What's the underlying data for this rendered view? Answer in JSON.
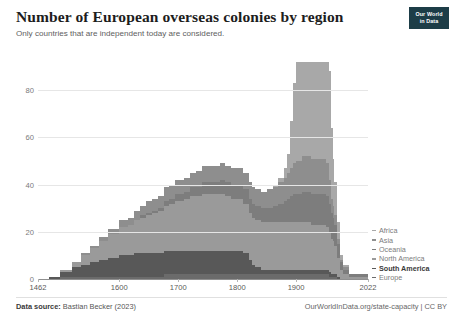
{
  "header": {
    "title": "Number of European overseas colonies by region",
    "subtitle": "Only countries that are independent today are considered.",
    "logo_line1": "Our World",
    "logo_line2": "in Data"
  },
  "footer": {
    "source_label": "Data source:",
    "source_value": "Bastian Becker (2023)",
    "credit": "OurWorldInData.org/state-capacity | CC BY"
  },
  "chart_data": {
    "type": "area",
    "stacked": true,
    "title": "Number of European overseas colonies by region",
    "subtitle": "Only countries that are independent today are considered.",
    "xlabel": "",
    "ylabel": "",
    "xlim": [
      1462,
      2022
    ],
    "ylim": [
      0,
      92
    ],
    "grid": true,
    "legend_position": "right",
    "yticks": [
      "0",
      "20",
      "40",
      "60",
      "80"
    ],
    "ytick_values": [
      0,
      20,
      40,
      60,
      80
    ],
    "xticks": [
      "1462",
      "1600",
      "1700",
      "1800",
      "1900",
      "2022"
    ],
    "xtick_values": [
      1462,
      1600,
      1700,
      1800,
      1900,
      2022
    ],
    "x": [
      1462,
      1480,
      1500,
      1520,
      1535,
      1550,
      1565,
      1580,
      1600,
      1615,
      1625,
      1635,
      1645,
      1655,
      1665,
      1675,
      1685,
      1695,
      1700,
      1710,
      1720,
      1730,
      1740,
      1750,
      1760,
      1770,
      1780,
      1790,
      1800,
      1810,
      1820,
      1825,
      1830,
      1840,
      1850,
      1860,
      1870,
      1880,
      1885,
      1890,
      1895,
      1900,
      1905,
      1910,
      1915,
      1920,
      1925,
      1930,
      1935,
      1940,
      1945,
      1950,
      1955,
      1960,
      1962,
      1965,
      1970,
      1975,
      1980,
      1990,
      2000,
      2010,
      2022
    ],
    "series": [
      {
        "name": "Europe",
        "color": "#6b6b6b",
        "values": [
          0,
          0,
          1,
          1,
          1,
          1,
          1,
          1,
          1,
          1,
          1,
          1,
          1,
          1,
          1,
          2,
          2,
          2,
          2,
          2,
          2,
          2,
          2,
          2,
          2,
          2,
          2,
          2,
          2,
          2,
          2,
          2,
          2,
          2,
          2,
          2,
          2,
          2,
          2,
          2,
          2,
          2,
          2,
          2,
          2,
          2,
          2,
          2,
          2,
          2,
          2,
          2,
          1,
          1,
          1,
          1,
          0,
          0,
          0,
          0,
          0,
          0,
          0
        ]
      },
      {
        "name": "South America",
        "color": "#585858",
        "values": [
          0,
          1,
          2,
          4,
          5,
          6,
          7,
          8,
          9,
          9,
          10,
          10,
          10,
          10,
          10,
          10,
          10,
          10,
          10,
          10,
          10,
          10,
          10,
          10,
          10,
          10,
          10,
          10,
          10,
          9,
          6,
          4,
          3,
          2,
          2,
          2,
          2,
          2,
          2,
          2,
          2,
          2,
          2,
          2,
          2,
          2,
          2,
          2,
          2,
          2,
          2,
          2,
          2,
          1,
          1,
          1,
          1,
          0,
          0,
          0,
          0,
          0,
          0
        ]
      },
      {
        "name": "North America",
        "color": "#9a9a9a",
        "values": [
          0,
          0,
          1,
          2,
          4,
          6,
          8,
          10,
          12,
          13,
          14,
          15,
          16,
          17,
          18,
          19,
          20,
          21,
          21,
          22,
          23,
          23,
          24,
          24,
          24,
          24,
          23,
          22,
          22,
          21,
          20,
          20,
          20,
          20,
          20,
          20,
          20,
          20,
          20,
          20,
          20,
          20,
          20,
          20,
          20,
          20,
          19,
          19,
          19,
          19,
          19,
          18,
          17,
          15,
          14,
          12,
          8,
          4,
          2,
          1,
          1,
          1,
          1
        ]
      },
      {
        "name": "Oceania",
        "color": "#7d7d7d",
        "values": [
          0,
          0,
          0,
          0,
          0,
          0,
          0,
          0,
          0,
          0,
          0,
          1,
          1,
          1,
          1,
          2,
          2,
          3,
          3,
          3,
          4,
          4,
          5,
          5,
          5,
          6,
          6,
          6,
          6,
          6,
          6,
          6,
          6,
          6,
          6,
          7,
          8,
          9,
          10,
          11,
          12,
          12,
          12,
          13,
          13,
          13,
          13,
          13,
          13,
          13,
          13,
          13,
          12,
          11,
          10,
          9,
          6,
          3,
          2,
          1,
          1,
          1,
          1
        ]
      },
      {
        "name": "Asia",
        "color": "#8e8e8e",
        "values": [
          0,
          0,
          0,
          0,
          1,
          1,
          2,
          2,
          3,
          3,
          4,
          4,
          5,
          5,
          5,
          6,
          6,
          6,
          6,
          6,
          6,
          7,
          7,
          7,
          7,
          7,
          7,
          7,
          7,
          7,
          7,
          7,
          7,
          7,
          8,
          8,
          9,
          10,
          11,
          12,
          13,
          14,
          14,
          15,
          15,
          15,
          15,
          15,
          15,
          15,
          15,
          14,
          10,
          6,
          5,
          4,
          2,
          1,
          1,
          0,
          0,
          0,
          0
        ]
      },
      {
        "name": "Africa",
        "color": "#a8a8a8",
        "values": [
          0,
          0,
          0,
          0,
          0,
          0,
          0,
          0,
          0,
          0,
          0,
          0,
          0,
          0,
          0,
          0,
          0,
          0,
          0,
          0,
          0,
          0,
          0,
          0,
          0,
          0,
          0,
          0,
          0,
          0,
          0,
          0,
          0,
          0,
          0,
          1,
          2,
          4,
          8,
          20,
          34,
          44,
          46,
          47,
          47,
          48,
          48,
          49,
          49,
          49,
          50,
          50,
          46,
          30,
          20,
          14,
          7,
          2,
          1,
          0,
          0,
          0,
          0
        ]
      }
    ],
    "totals_note": "Stacked total peaks near 90 colonies around 1930-1950"
  },
  "legend": {
    "items": [
      {
        "label": "Africa",
        "color": "#a8a8a8",
        "bold": false
      },
      {
        "label": "Asia",
        "color": "#8e8e8e",
        "bold": false
      },
      {
        "label": "Oceania",
        "color": "#7d7d7d",
        "bold": false
      },
      {
        "label": "North America",
        "color": "#9a9a9a",
        "bold": false
      },
      {
        "label": "South America",
        "color": "#585858",
        "bold": true
      },
      {
        "label": "Europe",
        "color": "#6b6b6b",
        "bold": false
      }
    ]
  }
}
